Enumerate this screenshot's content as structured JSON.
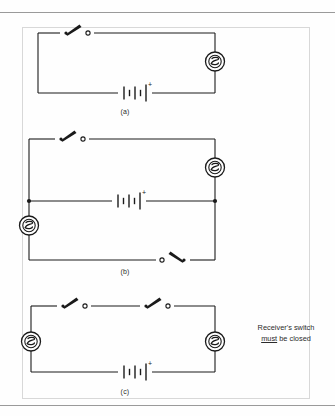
{
  "figure": {
    "type": "electrical-circuit-diagram",
    "border_color": "#d8d8d8",
    "line_color": "#1a1a1a",
    "rules": {
      "top_y": 12,
      "bottom_y": 405,
      "color": "#9a9a9a"
    }
  },
  "captions": {
    "a": "(a)",
    "b": "(b)",
    "c": "(c)"
  },
  "annotation": {
    "line1_prefix": "Receiver's switch",
    "line2_emphasis": "must",
    "line2_rest": " be closed",
    "full_text": "Receiver's switch must be closed"
  },
  "symbols": {
    "battery": {
      "name": "battery-symbol",
      "polarity_label": "+",
      "cells": 2
    },
    "buzzer": {
      "name": "buzzer-symbol",
      "shape": "circle-with-s-glyph"
    },
    "switch_open": {
      "name": "open-switch-symbol",
      "state": "open"
    },
    "junction": {
      "name": "junction-dot",
      "shape": "filled-circle"
    }
  },
  "circuits": [
    {
      "id": "a",
      "label": "(a)",
      "components": [
        {
          "type": "switch",
          "state": "open",
          "position": "top-left",
          "orientation": "lever-up-right"
        },
        {
          "type": "buzzer",
          "position": "right-side"
        },
        {
          "type": "battery",
          "position": "bottom-center",
          "polarity_label": "+"
        }
      ]
    },
    {
      "id": "b",
      "label": "(b)",
      "components": [
        {
          "type": "switch",
          "state": "open",
          "position": "top-left",
          "orientation": "lever-up-right"
        },
        {
          "type": "buzzer",
          "position": "right-upper"
        },
        {
          "type": "battery",
          "position": "middle-branch",
          "polarity_label": "+"
        },
        {
          "type": "buzzer",
          "position": "left-lower"
        },
        {
          "type": "switch",
          "state": "open",
          "position": "bottom-right",
          "orientation": "lever-down-right"
        },
        {
          "type": "junction",
          "position": "middle-left"
        },
        {
          "type": "junction",
          "position": "middle-right"
        }
      ]
    },
    {
      "id": "c",
      "label": "(c)",
      "components": [
        {
          "type": "switch",
          "state": "open",
          "position": "top-left",
          "orientation": "lever-up-right"
        },
        {
          "type": "switch",
          "state": "open",
          "position": "top-right",
          "orientation": "lever-up-right"
        },
        {
          "type": "buzzer",
          "position": "left-side"
        },
        {
          "type": "buzzer",
          "position": "right-side"
        },
        {
          "type": "battery",
          "position": "bottom-center",
          "polarity_label": "+"
        }
      ]
    }
  ],
  "battery_labels": {
    "a": "+",
    "b": "+",
    "c": "+"
  }
}
